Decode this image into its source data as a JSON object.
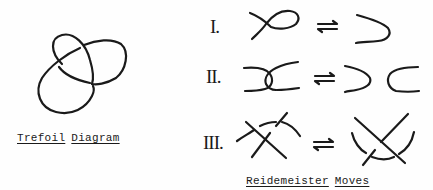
{
  "trefoil": {
    "caption_words": [
      "Trefoil",
      "Diagram"
    ]
  },
  "reidemeister": {
    "caption_words": [
      "Reidemeister",
      "Moves"
    ],
    "moves": [
      {
        "numeral": "I.",
        "arrow": "⇄"
      },
      {
        "numeral": "II.",
        "arrow": "⇄"
      },
      {
        "numeral": "III.",
        "arrow": "⇄"
      }
    ]
  },
  "colors": {
    "ink": "#1a1a1a",
    "paper": "#fefefe"
  }
}
